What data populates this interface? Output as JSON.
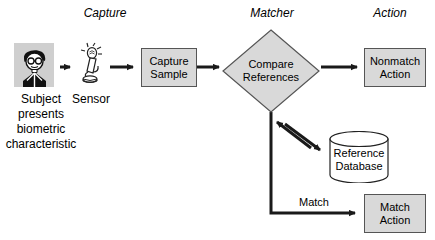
{
  "diagram": {
    "colors": {
      "box_fill": "#d9d9d9",
      "box_border": "#555555",
      "line": "#1a1a1a",
      "icon_bg": "#cfcfcf",
      "text": "#000000",
      "background": "#ffffff"
    },
    "phases": [
      {
        "id": "capture",
        "label": "Capture"
      },
      {
        "id": "matcher",
        "label": "Matcher"
      },
      {
        "id": "action",
        "label": "Action"
      }
    ],
    "nodes": {
      "subject": {
        "icon_name": "subject-person-icon",
        "caption_lines": [
          "Subject",
          "presents",
          "biometric",
          "characteristic"
        ]
      },
      "sensor": {
        "icon_name": "fingerprint-sensor-icon",
        "caption": "Sensor"
      },
      "capture_sample": {
        "lines": [
          "Capture",
          "Sample"
        ]
      },
      "compare_references": {
        "lines": [
          "Compare",
          "References"
        ]
      },
      "nonmatch_action": {
        "lines": [
          "Nonmatch",
          "Action"
        ]
      },
      "match_action": {
        "lines": [
          "Match",
          "Action"
        ]
      },
      "reference_database": {
        "lines": [
          "Reference",
          "Database"
        ]
      }
    },
    "edges": {
      "subject_to_sensor": {
        "label": ""
      },
      "sensor_to_capture": {
        "label": ""
      },
      "capture_to_compare": {
        "label": ""
      },
      "compare_to_nonmatch": {
        "label": ""
      },
      "compare_to_match": {
        "label": "Match"
      },
      "compare_db_exchange": {
        "label": ""
      }
    }
  }
}
